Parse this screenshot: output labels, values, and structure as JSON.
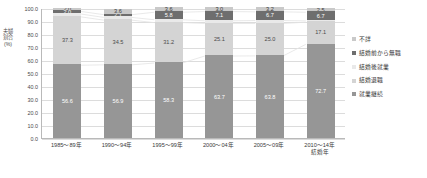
{
  "chart_data": {
    "type": "bar",
    "stacked": true,
    "title": "",
    "xlabel": "結婚年",
    "ylabel": "夫婦割合(%)",
    "ylim": [
      0,
      100
    ],
    "ytick_labels": [
      "100.0",
      "90.0",
      "80.0",
      "70.0",
      "60.0",
      "50.0",
      "40.0",
      "30.0",
      "20.0",
      "10.0",
      "0.0"
    ],
    "ytick_values": [
      100,
      90,
      80,
      70,
      60,
      50,
      40,
      30,
      20,
      10,
      0
    ],
    "grid": true,
    "legend_position": "right",
    "categories": [
      "1985～89年",
      "1990～94年",
      "1995～99年",
      "2000～04年",
      "2005～09年",
      "2010～14年"
    ],
    "series": [
      {
        "name": "就業継続",
        "color": "#969696",
        "values": [
          56.6,
          56.9,
          58.3,
          63.7,
          63.8,
          72.7
        ]
      },
      {
        "name": "結婚退職",
        "color": "#d4d4d4",
        "values": [
          37.3,
          34.5,
          31.2,
          25.1,
          25.0,
          17.1
        ]
      },
      {
        "name": "結婚後就業",
        "color": "#e9e9e9",
        "values": [
          2.2,
          2.1,
          2.2,
          2.1,
          2.3,
          1.0
        ]
      },
      {
        "name": "結婚前から無職",
        "color": "#6e6e6e",
        "values": [
          2.0,
          2.1,
          5.8,
          7.1,
          6.7,
          6.7
        ]
      },
      {
        "name": "不詳",
        "color": "#c9c9c9",
        "values": [
          2.0,
          3.6,
          3.6,
          3.0,
          3.2,
          2.5
        ]
      }
    ],
    "legend_order": [
      "不詳",
      "結婚前から無職",
      "結婚後就業",
      "結婚退職",
      "就業継続"
    ],
    "bar_labels": [
      {
        "category": "1985～89年",
        "keizoku": "56.6",
        "taishoku": "37.3",
        "mushoku": "2.0",
        "fushou": "2.0"
      },
      {
        "category": "1990～94年",
        "keizoku": "56.9",
        "taishoku": "34.5",
        "mushoku": "2.1",
        "fushou": "3.6"
      },
      {
        "category": "1995～99年",
        "keizoku": "58.3",
        "taishoku": "31.2",
        "mushoku": "5.8",
        "fushou": "3.6"
      },
      {
        "category": "2000～04年",
        "keizoku": "63.7",
        "taishoku": "25.1",
        "mushoku": "7.1",
        "fushou": "3.0"
      },
      {
        "category": "2005～09年",
        "keizoku": "63.8",
        "taishoku": "25.0",
        "mushoku": "6.7",
        "fushou": "3.2"
      },
      {
        "category": "2010～14年",
        "keizoku": "72.7",
        "taishoku": "17.1",
        "mushoku": "6.7",
        "fushou": "2.5"
      }
    ],
    "xlabel_suffix_last": "結婚年"
  },
  "legend": {
    "items": [
      {
        "label": "不詳",
        "color": "#c9c9c9"
      },
      {
        "label": "結婚前から無職",
        "color": "#6e6e6e"
      },
      {
        "label": "結婚後就業",
        "color": "#e9e9e9"
      },
      {
        "label": "結婚退職",
        "color": "#d4d4d4"
      },
      {
        "label": "就業継続",
        "color": "#969696"
      }
    ]
  }
}
